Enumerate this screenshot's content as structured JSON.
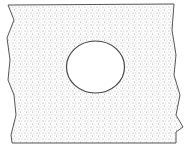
{
  "diagram": {
    "colors": {
      "outline": "#555555",
      "stipple": "#8a8a8a",
      "background": "#ffffff",
      "hole": "#ffffff"
    },
    "plate": {
      "top_y": 4,
      "bottom_y": 143
    },
    "hole": {
      "cx": 95.5,
      "cy": 67,
      "rx": 29,
      "ry": 26
    }
  }
}
